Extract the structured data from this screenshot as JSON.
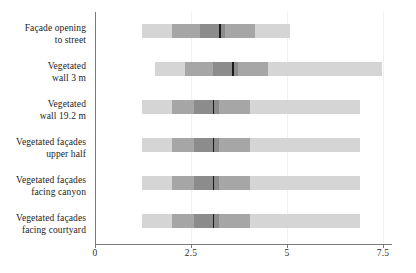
{
  "chart_data": {
    "type": "bar",
    "subtype": "horizontal-box-whisker-band",
    "title": "",
    "subtitle": "",
    "xlabel": "",
    "ylabel": "",
    "xlim": [
      0,
      7.8
    ],
    "ylim": null,
    "grid": true,
    "grid_axis": "x",
    "legend": null,
    "legend_position": "none",
    "axis": {
      "x_ticks": [
        0,
        2.5,
        5,
        7.5
      ],
      "x_tick_labels": [
        "0",
        "2.5",
        "5",
        "7.5"
      ],
      "y_axis_visible": true,
      "x_axis_visible": true
    },
    "categories": [
      "Façade opening to street",
      "Vegetated wall 3 m",
      "Vegetated wall 19.2 m",
      "Vegetated façades upper half",
      "Vegetated façades facing canyon",
      "Vegetated façades facing courtyard"
    ],
    "category_lines": [
      [
        "Façade opening",
        "to street"
      ],
      [
        "Vegetated",
        "wall 3 m"
      ],
      [
        "Vegetated",
        "wall 19.2 m"
      ],
      [
        "Vegetated façades",
        "upper half"
      ],
      [
        "Vegetated façades",
        "facing canyon"
      ],
      [
        "Vegetated façades",
        "facing courtyard"
      ]
    ],
    "colors": {
      "outer_band": "#d5d5d5",
      "mid_band": "#a6a6a6",
      "inner_band": "#8c8c8c",
      "median_line": "#1a1a1a",
      "axis": "#7a7a7a",
      "gridline": "#f0f0f0",
      "text": "#1c1c1c",
      "background": "#ffffff"
    },
    "series": [
      {
        "name": "Façade opening to street",
        "min": 1.22,
        "lower_mid": 2.0,
        "lower_inner": 2.73,
        "median": 3.23,
        "upper_inner": 3.39,
        "upper_mid": 4.17,
        "max": 5.08
      },
      {
        "name": "Vegetated wall 3 m",
        "min": 1.56,
        "lower_mid": 2.34,
        "lower_inner": 3.07,
        "median": 3.57,
        "upper_inner": 3.72,
        "upper_mid": 4.51,
        "max": 7.47
      },
      {
        "name": "Vegetated wall 19.2 m",
        "min": 1.22,
        "lower_mid": 2.0,
        "lower_inner": 2.58,
        "median": 3.07,
        "upper_inner": 3.23,
        "upper_mid": 4.04,
        "max": 6.9
      },
      {
        "name": "Vegetated façades upper half",
        "min": 1.22,
        "lower_mid": 2.0,
        "lower_inner": 2.58,
        "median": 3.07,
        "upper_inner": 3.23,
        "upper_mid": 4.04,
        "max": 6.9
      },
      {
        "name": "Vegetated façades facing canyon",
        "min": 1.22,
        "lower_mid": 2.0,
        "lower_inner": 2.58,
        "median": 3.07,
        "upper_inner": 3.23,
        "upper_mid": 4.04,
        "max": 6.9
      },
      {
        "name": "Vegetated façades facing courtyard",
        "min": 1.22,
        "lower_mid": 2.0,
        "lower_inner": 2.58,
        "median": 3.07,
        "upper_inner": 3.23,
        "upper_mid": 4.04,
        "max": 6.9
      }
    ]
  }
}
